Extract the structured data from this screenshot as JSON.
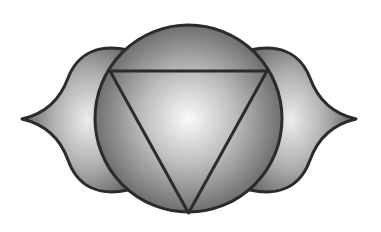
{
  "image": {
    "subject": "Ajna (third eye) chakra symbol",
    "description": "Grayscale emblem: a circle flanked by two petals, with an inverted triangle inscribed in the circle",
    "colors": {
      "background": "#ffffff",
      "outline": "#2b2b2b",
      "fill_light": "#f7f7f7",
      "fill_mid": "#b5b5b5",
      "fill_dark": "#5e5e5e"
    }
  }
}
